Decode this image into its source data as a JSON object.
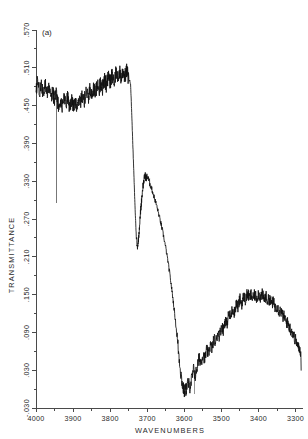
{
  "figure": {
    "panel_label": "(a)",
    "background_color": "#ffffff",
    "trace_color": "#111111",
    "axis_color": "#4a4a4a"
  },
  "chart_data": {
    "type": "line",
    "title": "",
    "subtitle": "",
    "panel": "(a)",
    "xlabel": "WAVENUMBERS",
    "ylabel": "TRANSMITTANCE",
    "xlim": [
      4000,
      3280
    ],
    "ylim": [
      -0.03,
      0.57
    ],
    "x_direction": "decreasing",
    "grid": false,
    "legend": null,
    "xticks": [
      4000,
      3900,
      3800,
      3700,
      3600,
      3500,
      3400,
      3300
    ],
    "xtick_labels": [
      "4000",
      "3900",
      "3800",
      "3700",
      "3600",
      "3500",
      "3400",
      "3300"
    ],
    "x_minor_tick_interval": 50,
    "yticks": [
      0.57,
      0.51,
      0.45,
      0.39,
      0.33,
      0.27,
      0.21,
      0.15,
      0.09,
      0.03,
      -0.03
    ],
    "ytick_labels": [
      ".570",
      ".510",
      ".450",
      ".390",
      ".330",
      ".270",
      ".210",
      ".150",
      ".090",
      ".030",
      "-.030"
    ],
    "y_minor_tick_interval": 0.03,
    "annotations": [
      {
        "text": "(a)",
        "x": 3985,
        "y": 0.545
      }
    ],
    "noise_amplitude": 0.013,
    "artifacts": [
      {
        "kind": "narrow-absorption-spike",
        "x": 3945,
        "y_top": 0.468,
        "y_bottom": 0.295
      },
      {
        "kind": "stray-vertical-mark",
        "x": 3572,
        "y_top": 0.03,
        "y_bottom": -0.008
      }
    ],
    "features": [
      {
        "name": "noisy high-transmittance plateau",
        "x_range": [
          4000,
          3745
        ],
        "y_approx": 0.48
      },
      {
        "name": "sharp absorption edge",
        "x_range": [
          3745,
          3730
        ],
        "y_drop_to": 0.225
      },
      {
        "name": "secondary band peak",
        "x": 3705,
        "y": 0.34
      },
      {
        "name": "steep descent to minimum",
        "x_range": [
          3700,
          3605
        ],
        "y_drop_to": 0.0
      },
      {
        "name": "absorption minimum",
        "x": 3610,
        "y": -0.005
      },
      {
        "name": "broad recovery band",
        "x_range": [
          3590,
          3400
        ],
        "y_peak": 0.152
      },
      {
        "name": "trailing decline",
        "x_range": [
          3400,
          3285
        ],
        "y_end": 0.03
      }
    ],
    "x": [
      4000,
      3995,
      3990,
      3985,
      3980,
      3975,
      3970,
      3965,
      3960,
      3955,
      3950,
      3945,
      3940,
      3935,
      3930,
      3925,
      3920,
      3915,
      3910,
      3905,
      3900,
      3895,
      3890,
      3885,
      3880,
      3875,
      3870,
      3865,
      3860,
      3855,
      3850,
      3845,
      3840,
      3835,
      3830,
      3825,
      3820,
      3815,
      3810,
      3805,
      3800,
      3795,
      3790,
      3785,
      3780,
      3775,
      3770,
      3765,
      3760,
      3755,
      3750,
      3745,
      3742,
      3739,
      3736,
      3733,
      3730,
      3727,
      3724,
      3721,
      3718,
      3715,
      3712,
      3709,
      3706,
      3703,
      3700,
      3695,
      3690,
      3685,
      3680,
      3675,
      3670,
      3665,
      3660,
      3655,
      3650,
      3645,
      3640,
      3635,
      3630,
      3625,
      3620,
      3615,
      3610,
      3605,
      3600,
      3595,
      3590,
      3585,
      3580,
      3575,
      3570,
      3565,
      3560,
      3555,
      3550,
      3545,
      3540,
      3535,
      3530,
      3525,
      3520,
      3515,
      3510,
      3505,
      3500,
      3495,
      3490,
      3485,
      3480,
      3475,
      3470,
      3465,
      3460,
      3455,
      3450,
      3445,
      3440,
      3435,
      3430,
      3425,
      3420,
      3415,
      3410,
      3405,
      3400,
      3395,
      3390,
      3385,
      3380,
      3375,
      3370,
      3365,
      3360,
      3355,
      3350,
      3345,
      3340,
      3335,
      3330,
      3325,
      3320,
      3315,
      3310,
      3305,
      3300,
      3295,
      3290,
      3285
    ],
    "y": [
      0.478,
      0.487,
      0.472,
      0.484,
      0.47,
      0.481,
      0.468,
      0.476,
      0.462,
      0.472,
      0.458,
      0.468,
      0.452,
      0.462,
      0.448,
      0.458,
      0.452,
      0.461,
      0.45,
      0.459,
      0.448,
      0.458,
      0.452,
      0.462,
      0.455,
      0.466,
      0.458,
      0.47,
      0.462,
      0.474,
      0.466,
      0.478,
      0.47,
      0.482,
      0.474,
      0.487,
      0.478,
      0.49,
      0.482,
      0.494,
      0.486,
      0.498,
      0.489,
      0.501,
      0.492,
      0.504,
      0.494,
      0.506,
      0.496,
      0.505,
      0.492,
      0.486,
      0.44,
      0.39,
      0.34,
      0.29,
      0.248,
      0.225,
      0.236,
      0.258,
      0.282,
      0.302,
      0.32,
      0.332,
      0.34,
      0.334,
      0.338,
      0.33,
      0.322,
      0.312,
      0.302,
      0.292,
      0.28,
      0.268,
      0.254,
      0.24,
      0.224,
      0.206,
      0.186,
      0.164,
      0.14,
      0.114,
      0.086,
      0.056,
      0.028,
      0.006,
      -0.004,
      0.0,
      0.01,
      0.004,
      0.016,
      0.03,
      0.022,
      0.036,
      0.05,
      0.042,
      0.056,
      0.048,
      0.062,
      0.056,
      0.07,
      0.064,
      0.08,
      0.074,
      0.09,
      0.084,
      0.1,
      0.094,
      0.11,
      0.104,
      0.12,
      0.114,
      0.128,
      0.122,
      0.136,
      0.13,
      0.143,
      0.136,
      0.148,
      0.141,
      0.152,
      0.145,
      0.15,
      0.143,
      0.15,
      0.144,
      0.152,
      0.146,
      0.15,
      0.143,
      0.147,
      0.14,
      0.143,
      0.136,
      0.138,
      0.13,
      0.132,
      0.124,
      0.124,
      0.116,
      0.115,
      0.107,
      0.104,
      0.096,
      0.092,
      0.084,
      0.078,
      0.07,
      0.064,
      0.056,
      0.05,
      0.042,
      0.038,
      0.032,
      0.03
    ]
  }
}
